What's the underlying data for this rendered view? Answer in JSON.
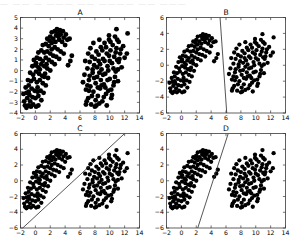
{
  "figure": {
    "top_artifact_text": "— —— — ———  —— ———— —— ———",
    "background_color": "#ffffff",
    "marker_color": "#000000",
    "line_color": "#2b2b2b",
    "axis_color": "#3b3b3b"
  },
  "chart_data": [
    {
      "type": "scatter",
      "title": "A",
      "xlabel": "",
      "ylabel": "",
      "xlim": [
        -2,
        14
      ],
      "ylim": [
        -4,
        5
      ],
      "xticks": [
        -2,
        0,
        2,
        4,
        6,
        8,
        10,
        12,
        14
      ],
      "yticks": [
        -4,
        -3,
        -2,
        -1,
        0,
        1,
        2,
        3,
        4,
        5
      ],
      "grid": false,
      "legend": "none",
      "decision_boundary": null,
      "series": [
        {
          "name": "class-1",
          "points": [
            [
              -1.4,
              -3.3
            ],
            [
              -1.2,
              -3.5
            ],
            [
              -0.9,
              -3.3
            ],
            [
              -0.6,
              -3.4
            ],
            [
              -1.5,
              -2.9
            ],
            [
              -1.1,
              -2.6
            ],
            [
              -0.7,
              -2.9
            ],
            [
              -0.3,
              -3.2
            ],
            [
              0.1,
              -3.4
            ],
            [
              0.4,
              -3.3
            ],
            [
              -1.6,
              -2.2
            ],
            [
              -1.2,
              -2.1
            ],
            [
              -0.8,
              -2.3
            ],
            [
              -0.4,
              -2.5
            ],
            [
              0.0,
              -2.6
            ],
            [
              0.4,
              -2.4
            ],
            [
              0.8,
              -2.8
            ],
            [
              -1.3,
              -1.6
            ],
            [
              -0.9,
              -1.4
            ],
            [
              -0.5,
              -1.7
            ],
            [
              -0.1,
              -1.9
            ],
            [
              0.3,
              -1.6
            ],
            [
              0.7,
              -1.9
            ],
            [
              1.1,
              -2.1
            ],
            [
              -1.0,
              -0.9
            ],
            [
              -0.6,
              -1.0
            ],
            [
              -0.2,
              -0.8
            ],
            [
              0.2,
              -1.1
            ],
            [
              0.6,
              -0.9
            ],
            [
              1.0,
              -1.2
            ],
            [
              1.4,
              -1.4
            ],
            [
              -0.7,
              -0.2
            ],
            [
              -0.3,
              -0.4
            ],
            [
              0.1,
              -0.1
            ],
            [
              0.5,
              -0.3
            ],
            [
              0.9,
              -0.5
            ],
            [
              1.3,
              -0.3
            ],
            [
              1.7,
              -0.7
            ],
            [
              -0.4,
              0.4
            ],
            [
              0.0,
              0.5
            ],
            [
              0.4,
              0.3
            ],
            [
              0.8,
              0.6
            ],
            [
              1.2,
              0.4
            ],
            [
              1.6,
              0.2
            ],
            [
              2.0,
              0.0
            ],
            [
              -0.2,
              1.0
            ],
            [
              0.2,
              1.2
            ],
            [
              0.6,
              1.1
            ],
            [
              1.0,
              0.9
            ],
            [
              1.4,
              1.2
            ],
            [
              1.8,
              1.0
            ],
            [
              2.2,
              0.8
            ],
            [
              2.6,
              0.6
            ],
            [
              0.4,
              1.7
            ],
            [
              0.8,
              1.9
            ],
            [
              1.2,
              1.7
            ],
            [
              1.6,
              1.8
            ],
            [
              2.0,
              1.6
            ],
            [
              2.4,
              1.4
            ],
            [
              2.8,
              1.3
            ],
            [
              3.2,
              1.1
            ],
            [
              1.0,
              2.4
            ],
            [
              1.4,
              2.5
            ],
            [
              1.8,
              2.3
            ],
            [
              2.2,
              2.6
            ],
            [
              2.6,
              2.2
            ],
            [
              3.0,
              2.0
            ],
            [
              3.4,
              1.8
            ],
            [
              3.8,
              1.6
            ],
            [
              1.6,
              3.0
            ],
            [
              2.0,
              3.2
            ],
            [
              2.4,
              3.0
            ],
            [
              2.8,
              3.3
            ],
            [
              3.2,
              2.9
            ],
            [
              3.6,
              2.7
            ],
            [
              4.0,
              2.4
            ],
            [
              2.2,
              3.6
            ],
            [
              2.6,
              3.7
            ],
            [
              3.0,
              3.5
            ],
            [
              3.4,
              3.4
            ],
            [
              3.8,
              3.1
            ],
            [
              4.3,
              2.9
            ],
            [
              2.9,
              3.9
            ],
            [
              3.3,
              3.8
            ],
            [
              3.7,
              3.7
            ],
            [
              4.1,
              3.4
            ],
            [
              4.6,
              3.0
            ],
            [
              4.9,
              1.4
            ],
            [
              4.7,
              0.9
            ],
            [
              4.4,
              0.5
            ],
            [
              0.6,
              0.1
            ],
            [
              1.2,
              -0.6
            ],
            [
              0.3,
              -2.0
            ],
            [
              -0.9,
              -2.0
            ],
            [
              2.2,
              2.0
            ],
            [
              1.5,
              0.6
            ],
            [
              2.7,
              2.7
            ],
            [
              3.1,
              3.2
            ],
            [
              1.9,
              2.8
            ],
            [
              0.1,
              0.7
            ]
          ]
        },
        {
          "name": "class-2",
          "points": [
            [
              6.4,
              -1.1
            ],
            [
              6.6,
              -0.4
            ],
            [
              6.8,
              -1.8
            ],
            [
              7.0,
              0.2
            ],
            [
              7.1,
              -2.6
            ],
            [
              7.2,
              -0.9
            ],
            [
              7.3,
              0.8
            ],
            [
              7.4,
              -1.5
            ],
            [
              7.5,
              -3.2
            ],
            [
              7.6,
              1.3
            ],
            [
              7.7,
              -0.2
            ],
            [
              7.8,
              -2.0
            ],
            [
              7.9,
              0.5
            ],
            [
              8.0,
              -3.4
            ],
            [
              8.1,
              -1.2
            ],
            [
              8.2,
              1.8
            ],
            [
              8.3,
              -0.6
            ],
            [
              8.4,
              -2.4
            ],
            [
              8.5,
              0.9
            ],
            [
              8.6,
              -3.1
            ],
            [
              8.7,
              -1.7
            ],
            [
              8.8,
              2.2
            ],
            [
              8.9,
              0.1
            ],
            [
              9.0,
              -2.9
            ],
            [
              9.1,
              1.1
            ],
            [
              9.2,
              -1.3
            ],
            [
              9.3,
              2.6
            ],
            [
              9.4,
              -0.3
            ],
            [
              9.5,
              -2.2
            ],
            [
              9.6,
              1.6
            ],
            [
              9.7,
              0.4
            ],
            [
              9.8,
              -1.9
            ],
            [
              9.9,
              2.9
            ],
            [
              10.0,
              -0.8
            ],
            [
              10.1,
              1.9
            ],
            [
              10.2,
              -2.6
            ],
            [
              10.3,
              0.7
            ],
            [
              10.4,
              2.4
            ],
            [
              10.5,
              -1.4
            ],
            [
              10.6,
              1.3
            ],
            [
              10.7,
              3.2
            ],
            [
              10.8,
              -0.1
            ],
            [
              10.9,
              2.1
            ],
            [
              11.0,
              1.0
            ],
            [
              11.1,
              -1.0
            ],
            [
              11.2,
              2.7
            ],
            [
              11.4,
              1.6
            ],
            [
              11.6,
              0.3
            ],
            [
              11.8,
              2.3
            ],
            [
              12.0,
              1.2
            ],
            [
              12.4,
              3.5
            ],
            [
              10.9,
              3.9
            ],
            [
              9.6,
              -3.3
            ],
            [
              8.2,
              -3.3
            ],
            [
              6.9,
              -2.9
            ],
            [
              7.4,
              2.1
            ],
            [
              8.6,
              2.9
            ],
            [
              9.9,
              3.3
            ],
            [
              6.7,
              0.9
            ],
            [
              7.2,
              -1.9
            ],
            [
              8.0,
              1.1
            ],
            [
              8.8,
              -0.9
            ],
            [
              9.3,
              0.9
            ],
            [
              10.2,
              -1.8
            ],
            [
              11.0,
              2.9
            ],
            [
              7.8,
              2.6
            ],
            [
              8.4,
              -1.6
            ],
            [
              9.0,
              1.9
            ],
            [
              9.7,
              -0.9
            ],
            [
              10.5,
              0.2
            ],
            [
              11.3,
              1.1
            ],
            [
              7.1,
              1.6
            ],
            [
              7.9,
              -0.7
            ],
            [
              8.7,
              0.6
            ],
            [
              9.5,
              2.2
            ],
            [
              10.3,
              -2.3
            ],
            [
              11.1,
              0.1
            ],
            [
              6.8,
              -3.2
            ],
            [
              12.3,
              1.6
            ],
            [
              8.3,
              0.3
            ],
            [
              9.1,
              -0.4
            ],
            [
              9.9,
              1.4
            ],
            [
              10.7,
              -0.6
            ],
            [
              7.6,
              -2.4
            ],
            [
              8.5,
              1.5
            ],
            [
              9.4,
              -1.6
            ],
            [
              10.1,
              2.7
            ],
            [
              11.5,
              2.0
            ],
            [
              7.3,
              -0.5
            ],
            [
              8.1,
              -2.8
            ],
            [
              9.2,
              -2.5
            ],
            [
              10.0,
              0.9
            ],
            [
              10.8,
              1.7
            ],
            [
              7.0,
              -1.4
            ],
            [
              8.9,
              -1.4
            ],
            [
              9.8,
              0.0
            ],
            [
              10.6,
              -1.1
            ],
            [
              11.2,
              0.8
            ],
            [
              7.7,
              0.1
            ],
            [
              8.6,
              -0.2
            ]
          ]
        }
      ]
    },
    {
      "type": "scatter",
      "title": "B",
      "xlabel": "",
      "ylabel": "",
      "xlim": [
        -2,
        14
      ],
      "ylim": [
        -6,
        6
      ],
      "xticks": [
        -2,
        0,
        2,
        4,
        6,
        8,
        10,
        12,
        14
      ],
      "yticks": [
        -6,
        -4,
        -2,
        0,
        2,
        4,
        6
      ],
      "grid": false,
      "legend": "none",
      "decision_boundary": {
        "x1": 5.2,
        "y1": 6,
        "x2": 6.1,
        "y2": -6,
        "description": "near-vertical separating line"
      }
    },
    {
      "type": "scatter",
      "title": "C",
      "xlabel": "",
      "ylabel": "",
      "xlim": [
        -2,
        14
      ],
      "ylim": [
        -6,
        6
      ],
      "xticks": [
        -2,
        0,
        2,
        4,
        6,
        8,
        10,
        12,
        14
      ],
      "yticks": [
        -6,
        -4,
        -2,
        0,
        2,
        4,
        6
      ],
      "grid": false,
      "legend": "none",
      "decision_boundary": {
        "x1": -1.7,
        "y1": -6,
        "x2": 12.0,
        "y2": 6,
        "description": "shallow positive-slope separating line"
      }
    },
    {
      "type": "scatter",
      "title": "D",
      "xlabel": "",
      "ylabel": "",
      "xlim": [
        -2,
        14
      ],
      "ylim": [
        -6,
        6
      ],
      "xticks": [
        -2,
        0,
        2,
        4,
        6,
        8,
        10,
        12,
        14
      ],
      "yticks": [
        -6,
        -4,
        -2,
        0,
        2,
        4,
        6
      ],
      "grid": false,
      "legend": "none",
      "decision_boundary": {
        "x1": 2.2,
        "y1": -6,
        "x2": 6.3,
        "y2": 6,
        "description": "steep positive-slope separating line"
      }
    }
  ]
}
